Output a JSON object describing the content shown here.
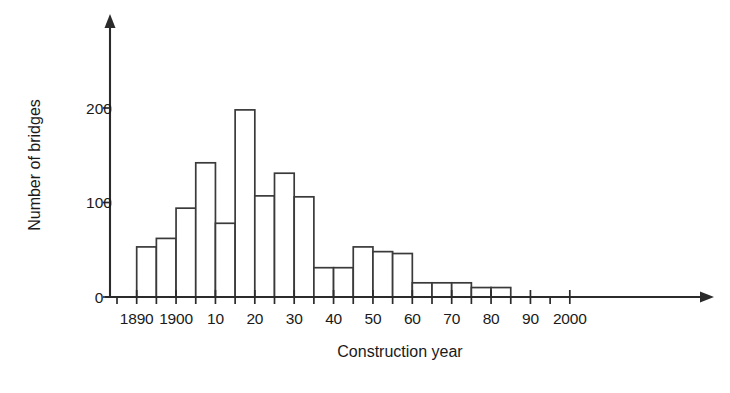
{
  "chart_data": {
    "type": "bar",
    "title": "",
    "subtitle": "",
    "xlabel": "Construction year",
    "ylabel": "Number of bridges",
    "grid": false,
    "legend": null,
    "bin_width_years": 5,
    "xlim": [
      1885,
      2005
    ],
    "ylim": [
      0,
      240
    ],
    "x_tick_labels": [
      "1890",
      "1900",
      "10",
      "20",
      "30",
      "40",
      "50",
      "60",
      "70",
      "80",
      "90",
      "2000"
    ],
    "x_tick_values": [
      1890,
      1900,
      1910,
      1920,
      1930,
      1940,
      1950,
      1960,
      1970,
      1980,
      1990,
      2000
    ],
    "x_minor_tick_values": [
      1885,
      1895,
      1905,
      1915,
      1925,
      1935,
      1945,
      1955,
      1965,
      1975,
      1985,
      1995
    ],
    "y_tick_labels": [
      "0",
      "100",
      "200"
    ],
    "y_tick_values": [
      0,
      100,
      200
    ],
    "categories": [
      "1885-1890",
      "1890-1895",
      "1895-1900",
      "1900-1905",
      "1905-1910",
      "1910-1915",
      "1915-1920",
      "1920-1925",
      "1925-1930",
      "1930-1935",
      "1935-1940",
      "1940-1945",
      "1945-1950",
      "1950-1955",
      "1955-1960",
      "1960-1965",
      "1965-1970",
      "1970-1975",
      "1975-1980",
      "1980-1985",
      "1985-1990"
    ],
    "bin_starts": [
      1885,
      1890,
      1895,
      1900,
      1905,
      1910,
      1915,
      1920,
      1925,
      1930,
      1935,
      1940,
      1945,
      1950,
      1955,
      1960,
      1965,
      1970,
      1975,
      1980,
      1985
    ],
    "values": [
      0,
      53,
      62,
      94,
      142,
      78,
      198,
      107,
      131,
      106,
      31,
      31,
      53,
      48,
      46,
      15,
      15,
      15,
      10,
      10,
      0
    ],
    "colors": {
      "bar_fill": "#ffffff",
      "bar_stroke": "#3a3a3a",
      "axis": "#2b2b2b",
      "text": "#1a1a1a"
    }
  }
}
